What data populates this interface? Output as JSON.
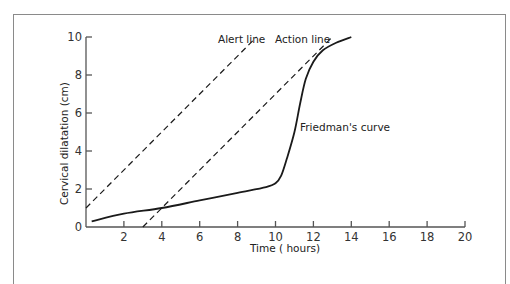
{
  "chart_data": {
    "type": "line",
    "title": "",
    "xlabel": "Time ( hours)",
    "ylabel": "Cervical dilatation (cm)",
    "xlim": [
      0,
      20
    ],
    "ylim": [
      0,
      10
    ],
    "x_ticks": [
      2,
      4,
      6,
      8,
      10,
      12,
      14,
      16,
      18,
      20
    ],
    "y_ticks": [
      0,
      2,
      4,
      6,
      8,
      10
    ],
    "grid": false,
    "legend": null,
    "series": [
      {
        "name": "Alert line",
        "style": "dashed",
        "points": [
          [
            0,
            1
          ],
          [
            9,
            10
          ]
        ]
      },
      {
        "name": "Action line",
        "style": "dashed",
        "points": [
          [
            3,
            0
          ],
          [
            13,
            10
          ]
        ]
      },
      {
        "name": "Friedman's curve",
        "style": "solid",
        "points": [
          [
            0.3,
            0.3
          ],
          [
            2,
            0.7
          ],
          [
            4,
            1.0
          ],
          [
            6,
            1.4
          ],
          [
            8,
            1.8
          ],
          [
            9.5,
            2.1
          ],
          [
            10,
            2.3
          ],
          [
            10.3,
            2.7
          ],
          [
            10.6,
            3.6
          ],
          [
            11,
            5.0
          ],
          [
            11.3,
            6.5
          ],
          [
            11.6,
            7.8
          ],
          [
            12,
            8.7
          ],
          [
            12.5,
            9.3
          ],
          [
            13.2,
            9.7
          ],
          [
            14,
            10
          ]
        ]
      }
    ],
    "annotations": [
      {
        "text": "Alert line",
        "x": 7.3,
        "y": 10.1
      },
      {
        "text": "Action line",
        "x": 10.8,
        "y": 10.1
      },
      {
        "text": "Friedman's curve",
        "x": 11.3,
        "y": 5.2
      }
    ]
  },
  "labels": {
    "alert": "Alert line",
    "action": "Action line",
    "friedman": "Friedman's curve",
    "xaxis": "Time ( hours)",
    "yaxis": "Cervical dilatation (cm)"
  },
  "ticks": {
    "x": [
      "2",
      "4",
      "6",
      "8",
      "10",
      "12",
      "14",
      "16",
      "18",
      "20"
    ],
    "y": [
      "0",
      "2",
      "4",
      "6",
      "8",
      "10"
    ]
  }
}
